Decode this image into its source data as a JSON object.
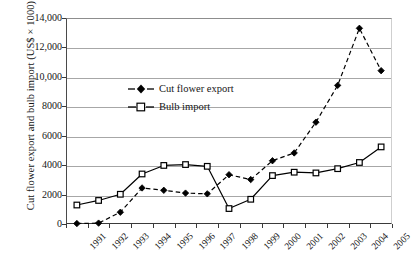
{
  "chart_data": {
    "type": "line",
    "title": "",
    "xlabel": "",
    "ylabel": "Cut flower export and bulb import (US$ × 1000)",
    "categories": [
      "1991",
      "1992",
      "1993",
      "1994",
      "1995",
      "1996",
      "1997",
      "1998",
      "1999",
      "2000",
      "2001",
      "2002",
      "2003",
      "2004",
      "2005"
    ],
    "ylim": [
      0,
      14000
    ],
    "yticks": [
      0,
      2000,
      4000,
      6000,
      8000,
      10000,
      12000,
      14000
    ],
    "ytick_labels": [
      "0",
      "2000",
      "4000",
      "6000",
      "8000",
      "10,000",
      "12,000",
      "14,000"
    ],
    "grid": "horizontal",
    "legend_position": "upper-left-inside",
    "series": [
      {
        "name": "Cut flower export",
        "marker": "filled-diamond",
        "line_style": "dashed",
        "color": "#000000",
        "values": [
          30,
          60,
          800,
          2450,
          2290,
          2100,
          2050,
          3350,
          3020,
          4300,
          4830,
          6920,
          9420,
          13300,
          10420
        ]
      },
      {
        "name": "Bulb import",
        "marker": "open-square",
        "line_style": "solid",
        "color": "#000000",
        "values": [
          1290,
          1600,
          2020,
          3400,
          3980,
          4040,
          3920,
          1050,
          1680,
          3290,
          3520,
          3470,
          3760,
          4180,
          5240
        ]
      }
    ]
  },
  "legend": {
    "items": [
      {
        "label": "Cut flower export"
      },
      {
        "label": "Bulb import"
      }
    ]
  },
  "axes": {
    "y_title": "Cut flower export and bulb import (US$ × 1000)"
  },
  "colors": {
    "ink": "#000000",
    "gridline": "#a7a7a7",
    "axis": "#3a3a3a",
    "background": "#ffffff"
  }
}
